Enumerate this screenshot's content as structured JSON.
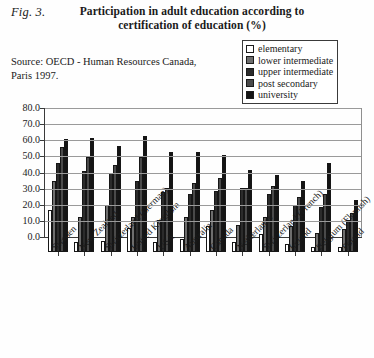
{
  "figure": {
    "label": "Fig. 3.",
    "title_line1": "Participation in adult education according to",
    "title_line2": "certification of education (%)",
    "source_line1": "Source:  OECD   - Human Resources Canada,",
    "source_line2": "Paris 1997."
  },
  "legend": {
    "position": "top-right",
    "items": [
      {
        "label": "elementary",
        "color": "#ffffff"
      },
      {
        "label": "lower intermediate",
        "color": "#6e6e6e"
      },
      {
        "label": "upper intermediate",
        "color": "#2b2b2b"
      },
      {
        "label": "post secondary",
        "color": "#4a4a4a"
      },
      {
        "label": "university",
        "color": "#141414"
      }
    ]
  },
  "chart_data": {
    "type": "bar",
    "title": "Participation in adult education according to certification of education (%)",
    "xlabel": "",
    "ylabel": "",
    "ylim": [
      0,
      80
    ],
    "yticks": [
      "0.0",
      "10.0",
      "20.0",
      "30.0",
      "40.0",
      "50.0",
      "60.0",
      "70.0",
      "80.0"
    ],
    "grid": true,
    "categories": [
      "Sweden",
      "New Zealand",
      "Switzerland (German)",
      "United Kingdom",
      "USA",
      "Australia",
      "Canada",
      "Netherlands",
      "Switzerland (French)",
      "Ireland",
      "Belgium (Flamish)",
      "Poland"
    ],
    "series": [
      {
        "name": "elementary",
        "color": "#ffffff",
        "values": [
          26.0,
          6.0,
          7.0,
          15.0,
          6.0,
          8.0,
          16.0,
          6.0,
          11.0,
          5.0,
          3.0,
          3.0
        ]
      },
      {
        "name": "lower intermediate",
        "color": "#6e6e6e",
        "values": [
          44.0,
          22.0,
          29.0,
          22.0,
          20.0,
          22.0,
          26.0,
          17.0,
          22.0,
          16.0,
          12.0,
          14.0
        ]
      },
      {
        "name": "upper intermediate",
        "color": "#2b2b2b",
        "values": [
          55.0,
          50.0,
          49.0,
          44.0,
          37.0,
          36.0,
          38.0,
          40.0,
          36.0,
          29.0,
          28.0,
          20.0
        ]
      },
      {
        "name": "post secondary",
        "color": "#4a4a4a",
        "values": [
          65.0,
          59.0,
          54.0,
          59.0,
          40.0,
          43.0,
          46.0,
          40.0,
          41.0,
          34.0,
          36.0,
          24.0
        ]
      },
      {
        "name": "university",
        "color": "#141414",
        "values": [
          70.0,
          71.0,
          66.0,
          72.0,
          62.0,
          62.0,
          60.0,
          51.0,
          48.0,
          44.0,
          55.0,
          32.0
        ]
      }
    ]
  }
}
